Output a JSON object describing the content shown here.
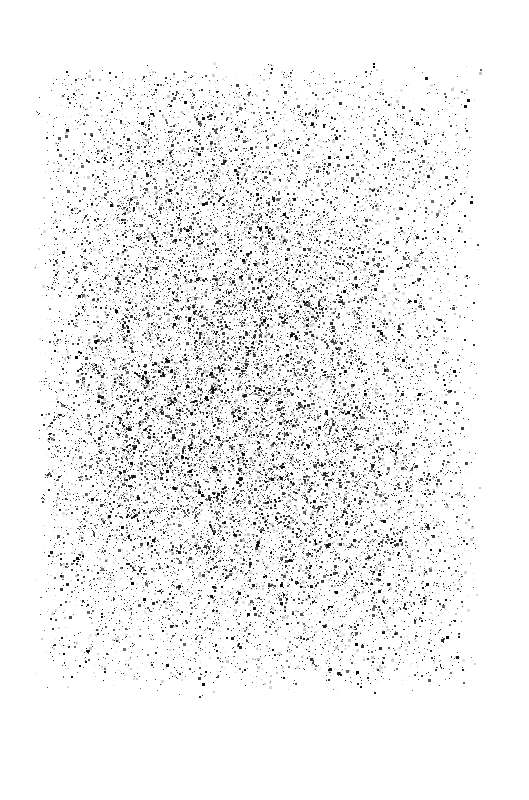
{
  "page": {
    "kind": "degraded-scanned-document",
    "width": 529,
    "height": 800,
    "background_color": "#ffffff",
    "legible_text": "",
    "description": "Heavily degraded scanned document page consisting entirely of black speckle noise on a white background. No legible glyphs, text baselines, rules, headers, page numbers, or UI chrome survive."
  },
  "noise_field": {
    "ink_color": "#000000",
    "ink_color_light": "#9a9a9a",
    "bounds": {
      "x": 30,
      "y": 58,
      "width": 455,
      "height": 642
    },
    "feather_px": 34,
    "speck_count": 26000,
    "speck_min_size": 1,
    "speck_max_size": 3,
    "cluster_fraction": 0.07,
    "seed": 20240517,
    "density_peaks": [
      {
        "cx": 0.4,
        "cy": 0.34,
        "rx": 0.34,
        "ry": 0.26,
        "weight": 1.0
      },
      {
        "cx": 0.44,
        "cy": 0.66,
        "rx": 0.38,
        "ry": 0.28,
        "weight": 0.95
      },
      {
        "cx": 0.62,
        "cy": 0.46,
        "rx": 0.3,
        "ry": 0.3,
        "weight": 0.72
      },
      {
        "cx": 0.24,
        "cy": 0.58,
        "rx": 0.24,
        "ry": 0.26,
        "weight": 0.66
      },
      {
        "cx": 0.74,
        "cy": 0.78,
        "rx": 0.26,
        "ry": 0.2,
        "weight": 0.6
      },
      {
        "cx": 0.3,
        "cy": 0.14,
        "rx": 0.26,
        "ry": 0.14,
        "weight": 0.4
      },
      {
        "cx": 0.8,
        "cy": 0.18,
        "rx": 0.2,
        "ry": 0.14,
        "weight": 0.26
      }
    ],
    "base_density": 0.17,
    "striation": {
      "enabled": true,
      "period_px": 23.0,
      "amplitude": 0.17,
      "phase": 0.6
    },
    "grain": {
      "enabled": true,
      "cell_px": 7.0,
      "amplitude": 0.3
    }
  }
}
